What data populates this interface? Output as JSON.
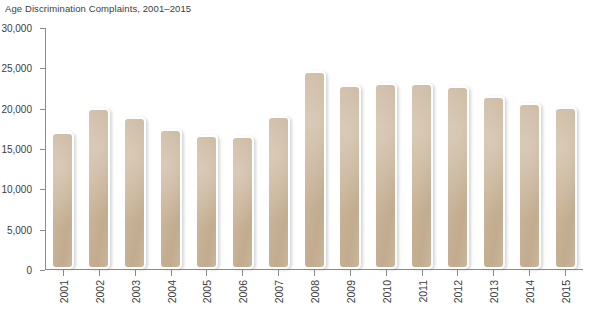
{
  "chart_data": {
    "type": "bar",
    "title": "Age Discrimination Complaints, 2001–2015",
    "xlabel": "",
    "ylabel": "",
    "categories": [
      "2001",
      "2002",
      "2003",
      "2004",
      "2005",
      "2006",
      "2007",
      "2008",
      "2009",
      "2010",
      "2011",
      "2012",
      "2013",
      "2014",
      "2015"
    ],
    "values": [
      17000,
      19900,
      18800,
      17400,
      16600,
      16500,
      19000,
      24600,
      22800,
      23000,
      23000,
      22700,
      21400,
      20600,
      20100
    ],
    "ylim": [
      0,
      30000
    ],
    "yticks": [
      0,
      5000,
      10000,
      15000,
      20000,
      25000,
      30000
    ],
    "ytick_labels": [
      "0",
      "5,000",
      "10,000",
      "15,000",
      "20,000",
      "25,000",
      "30,000"
    ],
    "grid": false,
    "legend": null,
    "bar_color": "#c8b398",
    "axis_color": "#8a8a8a",
    "text_color": "#3c3c3c",
    "background": "#ffffff"
  }
}
